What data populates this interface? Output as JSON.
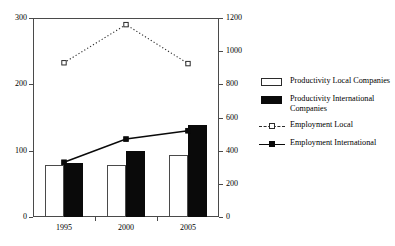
{
  "chart_data": {
    "type": "bar",
    "title": "",
    "subtitle": "",
    "xlabel": "",
    "ylabel": "",
    "y2label": "",
    "grid": false,
    "legend_position": "right",
    "categories": [
      "1995",
      "2000",
      "2005"
    ],
    "ylim": [
      0,
      300
    ],
    "y_ticks": [
      "0",
      "100",
      "200",
      "300"
    ],
    "y2lim": [
      0,
      1200
    ],
    "y2_ticks": [
      "0",
      "200",
      "400",
      "600",
      "800",
      "1000",
      "1200"
    ],
    "series": [
      {
        "name": "Productivity Local Companies",
        "type": "bar",
        "axis": "left",
        "style": "open-bar",
        "values": [
          78,
          78,
          93
        ]
      },
      {
        "name": "Productivity International Companies",
        "type": "bar",
        "axis": "left",
        "style": "filled-bar",
        "values": [
          81,
          99,
          138
        ]
      },
      {
        "name": "Employment Local",
        "type": "line",
        "axis": "right",
        "style": "dotted-hollow-square",
        "values": [
          930,
          1160,
          925
        ]
      },
      {
        "name": "Employment International",
        "type": "line",
        "axis": "right",
        "style": "solid-filled-square",
        "values": [
          330,
          470,
          520
        ]
      }
    ]
  },
  "legend": {
    "items": [
      {
        "label": "Productivity Local Companies",
        "key": "open-bar-key"
      },
      {
        "label": "Productivity International Companies",
        "key": "filled-bar-key"
      },
      {
        "label": "Employment Local",
        "key": "dotted-line-key"
      },
      {
        "label": "Employment International",
        "key": "solid-line-key"
      }
    ]
  },
  "colors": {
    "axis": "#4a4a4a",
    "bar_local_fill": "#ffffff",
    "bar_local_stroke": "#4a4a4a",
    "bar_intl_fill": "#0a0a0a",
    "line_local": "#2b2b2b",
    "line_intl": "#0a0a0a",
    "background": "#ffffff"
  }
}
